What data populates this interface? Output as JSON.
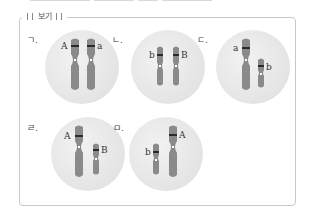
{
  "box": {
    "title": "보기"
  },
  "items": [
    {
      "label": "ㄱ.",
      "genes": [
        "A",
        "a"
      ]
    },
    {
      "label": "ㄴ.",
      "genes": [
        "b",
        "B"
      ]
    },
    {
      "label": "ㄷ.",
      "genes": [
        "a",
        "b"
      ]
    },
    {
      "label": "ㄹ.",
      "genes": [
        "A",
        "B"
      ]
    },
    {
      "label": "ㅁ.",
      "genes": [
        "b",
        "A"
      ]
    }
  ],
  "colors": {
    "chromosome": "#8a8a8a",
    "band": "#2a2a2a",
    "cell": "#e6e6e6",
    "centromere": "#ffffff"
  }
}
